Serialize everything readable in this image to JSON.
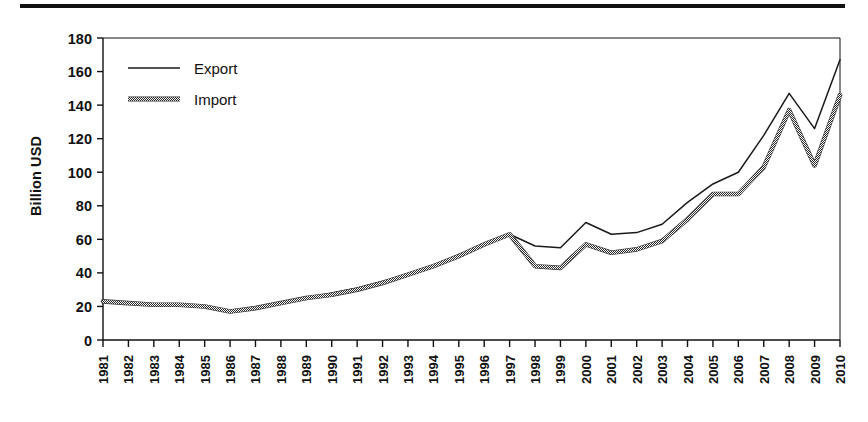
{
  "figure": {
    "top_rule": "horizontal-rule",
    "background_color": "#ffffff",
    "axis_color": "#111111"
  },
  "chart_data": {
    "type": "line",
    "title": "",
    "xlabel": "",
    "ylabel": "Billion USD",
    "ylim": [
      0,
      180
    ],
    "ytick_step": 20,
    "yticks": [
      0,
      20,
      40,
      60,
      80,
      100,
      120,
      140,
      160,
      180
    ],
    "grid": false,
    "legend_position": "top-left inside plot",
    "x": [
      "1981",
      "1982",
      "1983",
      "1984",
      "1985",
      "1986",
      "1987",
      "1988",
      "1989",
      "1990",
      "1991",
      "1992",
      "1993",
      "1994",
      "1995",
      "1996",
      "1997",
      "1998",
      "1999",
      "2000",
      "2001",
      "2002",
      "2003",
      "2004",
      "2005",
      "2006",
      "2007",
      "2008",
      "2009",
      "2010"
    ],
    "categories": [
      "1981",
      "1982",
      "1983",
      "1984",
      "1985",
      "1986",
      "1987",
      "1988",
      "1989",
      "1990",
      "1991",
      "1992",
      "1993",
      "1994",
      "1995",
      "1996",
      "1997",
      "1998",
      "1999",
      "2000",
      "2001",
      "2002",
      "2003",
      "2004",
      "2005",
      "2006",
      "2007",
      "2008",
      "2009",
      "2010"
    ],
    "series": [
      {
        "name": "Export",
        "color": "#1a1a1a",
        "style": "solid-thin",
        "values": [
          23,
          22,
          21,
          21,
          20,
          17,
          19,
          22,
          25,
          28,
          31,
          35,
          39,
          44,
          51,
          57,
          63,
          56,
          55,
          70,
          63,
          64,
          69,
          82,
          93,
          100,
          122,
          147,
          126,
          167
        ]
      },
      {
        "name": "Import",
        "color": "#555555",
        "style": "dithered-thick",
        "values": [
          23,
          22,
          21,
          21,
          20,
          17,
          19,
          22,
          25,
          27,
          30,
          34,
          39,
          44,
          50,
          57,
          63,
          44,
          43,
          57,
          52,
          54,
          59,
          72,
          87,
          87,
          103,
          137,
          104,
          146
        ]
      }
    ]
  },
  "legend": {
    "items": [
      {
        "label": "Export",
        "swatch": "thin-line-swatch"
      },
      {
        "label": "Import",
        "swatch": "thick-dithered-line-swatch"
      }
    ]
  }
}
